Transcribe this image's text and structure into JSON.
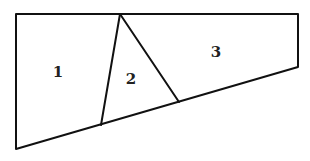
{
  "diagram": {
    "type": "partitioned-quadrilateral",
    "outline": {
      "points": [
        [
          16,
          14
        ],
        [
          298,
          14
        ],
        [
          298,
          67
        ],
        [
          16,
          149
        ]
      ]
    },
    "dividers": [
      {
        "name": "left-divider",
        "from": [
          120,
          14
        ],
        "to": [
          101,
          125
        ]
      },
      {
        "name": "right-divider",
        "from": [
          120,
          14
        ],
        "to": [
          179,
          102
        ]
      }
    ],
    "regions": [
      {
        "id": "region-1",
        "label": "1",
        "x": 58,
        "y": 73
      },
      {
        "id": "region-2",
        "label": "2",
        "x": 131,
        "y": 80
      },
      {
        "id": "region-3",
        "label": "3",
        "x": 216,
        "y": 53
      }
    ],
    "colors": {
      "stroke": "#111111",
      "label": "#222222",
      "background": "#ffffff"
    }
  }
}
